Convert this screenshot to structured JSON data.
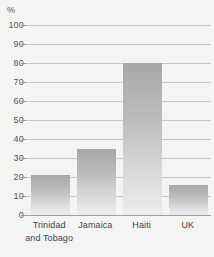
{
  "chart_data": {
    "type": "bar",
    "title": "",
    "subtitle": "",
    "xlabel": "",
    "ylabel": "%",
    "unit_label": "%",
    "categories": [
      "Trinidad and Tobago",
      "Jamaica",
      "Haiti",
      "UK"
    ],
    "category_lines": [
      [
        "Trinidad",
        "and Tobago"
      ],
      [
        "Jamaica"
      ],
      [
        "Haiti"
      ],
      [
        "UK"
      ]
    ],
    "values": [
      21,
      35,
      80,
      16
    ],
    "ylim": [
      0,
      100
    ],
    "ytick_step": 10,
    "ytick_labels": [
      "100",
      "90",
      "80",
      "70",
      "60",
      "50",
      "40",
      "30",
      "20",
      "10",
      "0"
    ],
    "ytick_values": [
      100,
      90,
      80,
      70,
      60,
      50,
      40,
      30,
      20,
      10,
      0
    ],
    "grid": true,
    "grid_orientation": "horizontal",
    "legend": false,
    "legend_position": "none",
    "series": [
      {
        "name": "",
        "values": [
          21,
          35,
          80,
          16
        ]
      }
    ]
  },
  "style": {
    "background_color": "#f4f4f2",
    "gridline_color": "#c9cac6",
    "axis_line_color": "#9b9c99",
    "bar_color_top": "#a6a7a6",
    "bar_color_bottom": "#eeefec",
    "text_color": "#55565a",
    "category_text_color": "#43444a"
  }
}
